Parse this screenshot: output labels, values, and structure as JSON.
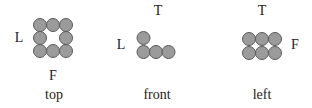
{
  "colors": {
    "ball_fill": "#9b9b9b",
    "ball_stroke": "#5a5a5a",
    "text": "#222222",
    "background": "#ffffff"
  },
  "views": [
    {
      "caption": "top",
      "labels": {
        "left": "L",
        "bottom": "F"
      },
      "grid": "3x3 ring, center empty",
      "balls": [
        [
          40,
          25
        ],
        [
          53,
          25
        ],
        [
          66,
          25
        ],
        [
          40,
          38
        ],
        [
          66,
          38
        ],
        [
          40,
          51
        ],
        [
          53,
          51
        ],
        [
          66,
          51
        ]
      ]
    },
    {
      "caption": "front",
      "labels": {
        "top": "T",
        "left": "L"
      },
      "grid": "L-shape: one on top of leftmost of a row of 3",
      "balls": [
        [
          143,
          38
        ],
        [
          143,
          52
        ],
        [
          156,
          52
        ],
        [
          169,
          52
        ]
      ]
    },
    {
      "caption": "left",
      "labels": {
        "top": "T",
        "right": "F"
      },
      "grid": "2 rows x 3 columns",
      "balls": [
        [
          249,
          39
        ],
        [
          262,
          39
        ],
        [
          275,
          39
        ],
        [
          249,
          53
        ],
        [
          262,
          53
        ],
        [
          275,
          53
        ]
      ]
    }
  ]
}
